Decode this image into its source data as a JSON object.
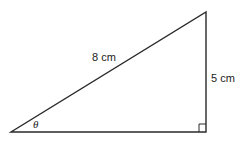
{
  "diagram": {
    "type": "right-triangle",
    "hypotenuse_label": "8 cm",
    "opposite_label": "5 cm",
    "angle_label": "θ",
    "right_angle_marker": true,
    "colors": {
      "stroke": "#2a2a2a",
      "background": "#ffffff"
    }
  }
}
